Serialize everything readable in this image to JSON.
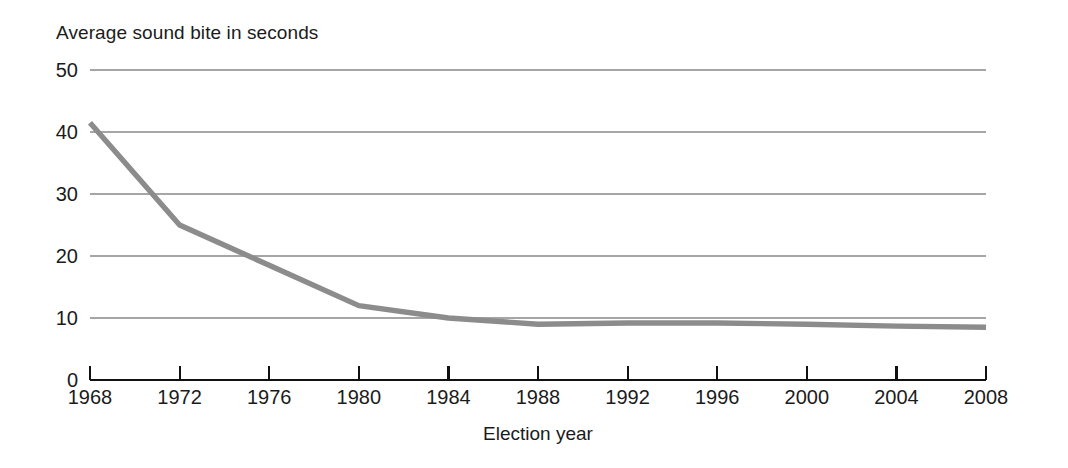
{
  "chart_data": {
    "type": "line",
    "title": "Average sound bite in seconds",
    "xlabel": "Election year",
    "ylabel": "",
    "x": [
      1968,
      1972,
      1976,
      1980,
      1984,
      1988,
      1992,
      1996,
      2000,
      2004,
      2008
    ],
    "values": [
      41.5,
      25.0,
      18.5,
      12.0,
      10.0,
      9.0,
      9.2,
      9.2,
      9.0,
      8.7,
      8.5
    ],
    "series": [
      {
        "name": "Average sound bite in seconds",
        "values": [
          41.5,
          25.0,
          18.5,
          12.0,
          10.0,
          9.0,
          9.2,
          9.2,
          9.0,
          8.7,
          8.5
        ]
      }
    ],
    "categories": [
      "1968",
      "1972",
      "1976",
      "1980",
      "1984",
      "1988",
      "1992",
      "1996",
      "2000",
      "2004",
      "2008"
    ],
    "xtick_labels": [
      "1968",
      "1972",
      "1976",
      "1980",
      "1984",
      "1988",
      "1992",
      "1996",
      "2000",
      "2004",
      "2008"
    ],
    "ytick_labels": [
      "0",
      "10",
      "20",
      "30",
      "40",
      "50"
    ],
    "ytick_values": [
      0,
      10,
      20,
      30,
      40,
      50
    ],
    "ylim": [
      0,
      50
    ],
    "xlim": [
      1968,
      2008
    ],
    "grid": "horizontal",
    "gridline_values": [
      10,
      20,
      30,
      40,
      50
    ],
    "legend": "none",
    "line_color": "#8c8c8c",
    "gridline_color": "#a6a6a6",
    "axis_color": "#111111",
    "text_color": "#1b1b1b",
    "background_color": "#ffffff"
  },
  "labels": {
    "y_0": "0",
    "y_10": "10",
    "y_20": "20",
    "y_30": "30",
    "y_40": "40",
    "y_50": "50",
    "x_1968": "1968",
    "x_1972": "1972",
    "x_1976": "1976",
    "x_1980": "1980",
    "x_1984": "1984",
    "x_1988": "1988",
    "x_1992": "1992",
    "x_1996": "1996",
    "x_2000": "2000",
    "x_2004": "2004",
    "x_2008": "2008"
  }
}
